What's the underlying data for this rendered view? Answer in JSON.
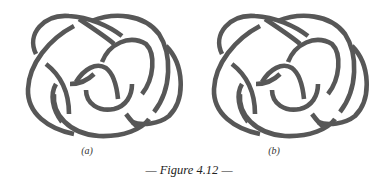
{
  "figure": {
    "caption": "— Figure 4.12 —",
    "stroke_color": "#575757",
    "background": "#ffffff",
    "panels": [
      {
        "id": "a",
        "label": "(a)",
        "description": "knot diagram"
      },
      {
        "id": "b",
        "label": "(b)",
        "description": "knot diagram"
      }
    ]
  }
}
